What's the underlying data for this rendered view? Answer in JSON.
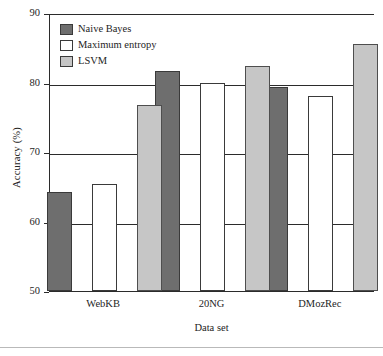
{
  "chart_data": {
    "type": "bar",
    "title": "",
    "xlabel": "Data set",
    "ylabel": "Accuracy (%)",
    "categories": [
      "WebKB",
      "20NG",
      "DMozRec"
    ],
    "series": [
      {
        "name": "Naive Bayes",
        "color": "#6e6e6e",
        "values": [
          64.2,
          81.6,
          79.3
        ]
      },
      {
        "name": "Maximum entropy",
        "color": "#ffffff",
        "values": [
          65.4,
          79.9,
          78.0
        ]
      },
      {
        "name": "LSVM",
        "color": "#c6c6c6",
        "values": [
          76.8,
          82.4,
          85.6
        ]
      }
    ],
    "ylim": [
      50,
      90
    ],
    "yticks": [
      50,
      60,
      70,
      80,
      90
    ],
    "ytick_labels": [
      "50",
      "60",
      "70",
      "80",
      "90"
    ],
    "grid": true,
    "legend_position": "upper left"
  }
}
